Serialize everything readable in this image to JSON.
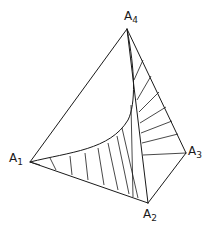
{
  "figure": {
    "stroke_color": "#1a1a1a",
    "background": "#ffffff"
  },
  "vertices": [
    {
      "id": "A1",
      "letter": "A",
      "index": "1",
      "x": 30,
      "y": 162,
      "label_x": 9,
      "label_y": 152
    },
    {
      "id": "A2",
      "letter": "A",
      "index": "2",
      "x": 148,
      "y": 203,
      "label_x": 143,
      "label_y": 208
    },
    {
      "id": "A3",
      "letter": "A",
      "index": "3",
      "x": 186,
      "y": 153,
      "label_x": 188,
      "label_y": 145
    },
    {
      "id": "A4",
      "letter": "A",
      "index": "4",
      "x": 127,
      "y": 29,
      "label_x": 124,
      "label_y": 10
    }
  ],
  "edges": [
    {
      "from": "A1",
      "to": "A4"
    },
    {
      "from": "A1",
      "to": "A2"
    },
    {
      "from": "A2",
      "to": "A3"
    },
    {
      "from": "A3",
      "to": "A4"
    },
    {
      "from": "A2",
      "to": "A4"
    }
  ],
  "curve": {
    "path": "M30,162 C70,152 110,150 128,120 C136,104 135,70 127,29"
  },
  "rulings_bottom": [
    [
      [
        30,
        162
      ],
      [
        40,
        165
      ]
    ],
    [
      [
        50,
        158
      ],
      [
        56,
        170
      ]
    ],
    [
      [
        70,
        156
      ],
      [
        72,
        175
      ]
    ],
    [
      [
        85,
        153
      ],
      [
        88,
        180
      ]
    ],
    [
      [
        98,
        148
      ],
      [
        104,
        185
      ]
    ],
    [
      [
        108,
        143
      ],
      [
        118,
        190
      ]
    ],
    [
      [
        117,
        136
      ],
      [
        129,
        194
      ]
    ],
    [
      [
        122,
        128
      ],
      [
        138,
        198
      ]
    ],
    [
      [
        131,
        105
      ],
      [
        133,
        197
      ]
    ]
  ],
  "rulings_right": [
    [
      [
        134,
        80
      ],
      [
        143,
        60
      ]
    ],
    [
      [
        137,
        100
      ],
      [
        151,
        76
      ]
    ],
    [
      [
        139,
        112
      ],
      [
        159,
        92
      ]
    ],
    [
      [
        140,
        123
      ],
      [
        166,
        107
      ]
    ],
    [
      [
        141,
        133
      ],
      [
        172,
        121
      ]
    ],
    [
      [
        142,
        143
      ],
      [
        178,
        134
      ]
    ],
    [
      [
        143,
        155
      ],
      [
        186,
        153
      ]
    ]
  ]
}
